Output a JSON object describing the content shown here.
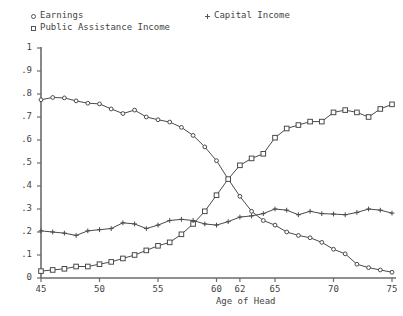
{
  "chart_data": {
    "type": "line",
    "title": "",
    "xlabel": "Age of Head",
    "ylabel": "",
    "xlim": [
      45,
      75
    ],
    "ylim": [
      0,
      1
    ],
    "grid": false,
    "legend_position": "top",
    "xticks": [
      "45",
      "50",
      "55",
      "60",
      "62",
      "65",
      "70",
      "75"
    ],
    "xtick_values": [
      45,
      50,
      55,
      60,
      62,
      65,
      70,
      75
    ],
    "yticks": [
      "0",
      ".1",
      ".2",
      ".3",
      ".4",
      ".5",
      ".6",
      ".7",
      ".8",
      ".9",
      "1"
    ],
    "ytick_values": [
      0,
      0.1,
      0.2,
      0.3,
      0.4,
      0.5,
      0.6,
      0.7,
      0.8,
      0.9,
      1
    ],
    "x": [
      45,
      46,
      47,
      48,
      49,
      50,
      51,
      52,
      53,
      54,
      55,
      56,
      57,
      58,
      59,
      60,
      61,
      62,
      63,
      64,
      65,
      66,
      67,
      68,
      69,
      70,
      71,
      72,
      73,
      74,
      75
    ],
    "series": [
      {
        "name": "Earnings",
        "marker": "circle",
        "values": [
          0.775,
          0.785,
          0.783,
          0.77,
          0.76,
          0.757,
          0.735,
          0.715,
          0.73,
          0.7,
          0.688,
          0.678,
          0.655,
          0.62,
          0.57,
          0.51,
          0.43,
          0.355,
          0.29,
          0.25,
          0.23,
          0.2,
          0.185,
          0.175,
          0.155,
          0.125,
          0.105,
          0.06,
          0.045,
          0.035,
          0.025
        ]
      },
      {
        "name": "Public Assistance Income",
        "marker": "square",
        "values": [
          0.03,
          0.035,
          0.04,
          0.05,
          0.05,
          0.06,
          0.07,
          0.085,
          0.1,
          0.12,
          0.14,
          0.155,
          0.19,
          0.235,
          0.29,
          0.36,
          0.43,
          0.49,
          0.52,
          0.54,
          0.61,
          0.65,
          0.665,
          0.68,
          0.68,
          0.72,
          0.73,
          0.72,
          0.7,
          0.735,
          0.755
        ]
      },
      {
        "name": "Capital Income",
        "marker": "plus",
        "values": [
          0.205,
          0.2,
          0.195,
          0.185,
          0.205,
          0.21,
          0.215,
          0.24,
          0.235,
          0.215,
          0.23,
          0.25,
          0.255,
          0.25,
          0.235,
          0.23,
          0.245,
          0.265,
          0.27,
          0.28,
          0.3,
          0.295,
          0.275,
          0.29,
          0.28,
          0.278,
          0.275,
          0.285,
          0.3,
          0.295,
          0.282
        ]
      }
    ]
  },
  "legend": {
    "earnings": "Earnings",
    "public": "Public Assistance Income",
    "capital": "Capital Income"
  },
  "colors": {
    "line": "#4a4a4a",
    "text": "#444444",
    "axis": "#6b6b6b",
    "background": "#ffffff"
  }
}
